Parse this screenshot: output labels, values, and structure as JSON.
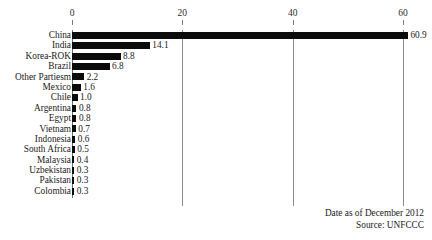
{
  "footer": {
    "date_line": "Date as of December 2012",
    "source_line": "Source: UNFCCC"
  },
  "chart_data": {
    "type": "bar",
    "orientation": "horizontal",
    "title": "",
    "subtitle": "",
    "xlabel": "",
    "ylabel": "",
    "xlim": [
      0,
      63
    ],
    "xticks": [
      0,
      20,
      40,
      60
    ],
    "xtick_labels": [
      "0",
      "20",
      "40",
      "60"
    ],
    "grid": true,
    "grid_axis": "x",
    "legend": false,
    "legend_position": "none",
    "bar_color": "#0b0b0b",
    "categories": [
      "China",
      "India",
      "Korea-ROK",
      "Brazil",
      "Other Partiesm",
      "Mexico",
      "Chile",
      "Argentina",
      "Egypt",
      "Vietnam",
      "Indonesia",
      "South Africa",
      "Malaysia",
      "Uzbekistan",
      "Pakistan",
      "Colombia"
    ],
    "values": [
      60.9,
      14.1,
      8.8,
      6.8,
      2.2,
      1.6,
      1.0,
      0.8,
      0.8,
      0.7,
      0.6,
      0.5,
      0.4,
      0.3,
      0.3,
      0.3
    ],
    "data_labels": [
      "60.9",
      "14.1",
      "8.8",
      "6.8",
      "2.2",
      "1.6",
      "1.0",
      "0.8",
      "0.8",
      "0.7",
      "0.6",
      "0.5",
      "0.4",
      "0.3",
      "0.3",
      "0.3"
    ],
    "annotations": [
      "Date as of December 2012",
      "Source: UNFCCC"
    ]
  }
}
